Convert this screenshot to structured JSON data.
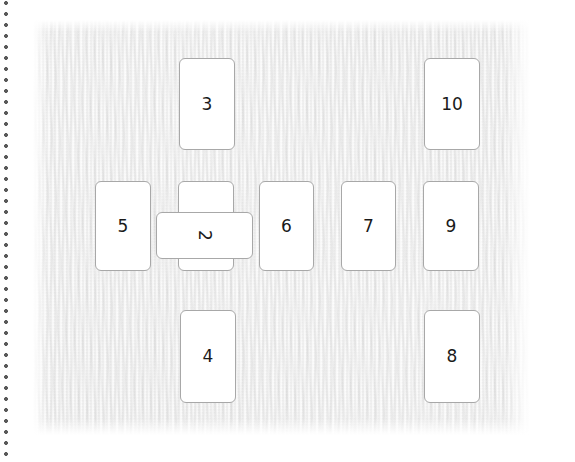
{
  "canvas": {
    "width": 575,
    "height": 462,
    "background_color": "#ffffff",
    "paper_color": "#f4f4f4"
  },
  "rail": {
    "name": "dotted-rail",
    "orientation": "vertical",
    "edge": "left",
    "dot_color": "#595959",
    "dot_spacing_px": 11
  },
  "board": {
    "title": "",
    "card_border_color": "#a8a8a8",
    "card_fill_color": "#ffffff",
    "card_text_color": "#1a1a1a"
  },
  "cards": [
    {
      "label": "3",
      "x": 179,
      "y": 58,
      "w": 56,
      "h": 92,
      "rotated": false,
      "z": 1
    },
    {
      "label": "10",
      "x": 424,
      "y": 58,
      "w": 56,
      "h": 92,
      "rotated": false,
      "z": 1
    },
    {
      "label": "5",
      "x": 95,
      "y": 181,
      "w": 56,
      "h": 90,
      "rotated": false,
      "z": 1
    },
    {
      "label": "1",
      "x": 178,
      "y": 181,
      "w": 56,
      "h": 90,
      "rotated": false,
      "z": 1
    },
    {
      "label": "6",
      "x": 259,
      "y": 181,
      "w": 55,
      "h": 90,
      "rotated": false,
      "z": 1
    },
    {
      "label": "7",
      "x": 341,
      "y": 181,
      "w": 55,
      "h": 90,
      "rotated": false,
      "z": 1
    },
    {
      "label": "9",
      "x": 423,
      "y": 181,
      "w": 56,
      "h": 90,
      "rotated": false,
      "z": 1
    },
    {
      "label": "2",
      "x": 156,
      "y": 212,
      "w": 97,
      "h": 47,
      "rotated": true,
      "z": 5
    },
    {
      "label": "4",
      "x": 180,
      "y": 310,
      "w": 56,
      "h": 93,
      "rotated": false,
      "z": 1
    },
    {
      "label": "8",
      "x": 424,
      "y": 310,
      "w": 56,
      "h": 93,
      "rotated": false,
      "z": 1
    }
  ]
}
